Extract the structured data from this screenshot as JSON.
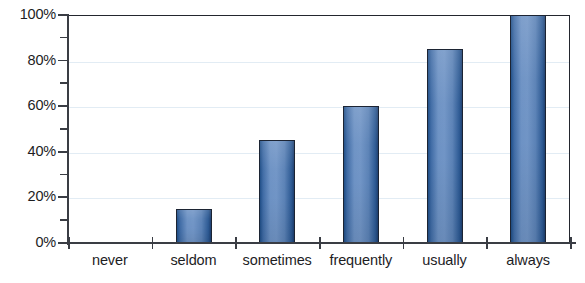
{
  "chart_data": {
    "type": "bar",
    "title": "",
    "subtitle": "",
    "xlabel": "",
    "ylabel": "",
    "categories": [
      "never",
      "seldom",
      "sometimes",
      "frequently",
      "usually",
      "always"
    ],
    "values": [
      0,
      15,
      45,
      60,
      85,
      100
    ],
    "value_labels": [
      "0%",
      "15%",
      "45%",
      "60%",
      "85%",
      "100%"
    ],
    "ylim": [
      0,
      100
    ],
    "ytick_values": [
      0,
      20,
      40,
      60,
      80,
      100
    ],
    "ytick_labels": [
      "0%",
      "20%",
      "40%",
      "60%",
      "80%",
      "100%"
    ],
    "yminor_tick_values": [
      10,
      30,
      50,
      70,
      90
    ],
    "grid": "horizontal",
    "legend": "none",
    "series": [
      {
        "name": "",
        "values": [
          0,
          15,
          45,
          60,
          85,
          100
        ]
      }
    ],
    "annotations": []
  },
  "style": {
    "bar_fill_light": "#7195c6",
    "bar_fill_dark": "#1f4e87",
    "bar_outline": "#1c2433",
    "gridline_color": "#e2ecf4",
    "axis_color": "#3a3d44",
    "plot_border_color": "#23262e",
    "text_color": "#1d1d1f",
    "background": "#ffffff"
  }
}
